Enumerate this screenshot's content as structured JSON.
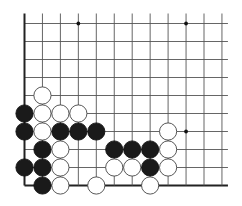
{
  "board": {
    "type": "go-diagram",
    "view": "lower-left corner fragment",
    "columns": 12,
    "rows": 10,
    "grid": {
      "x0": 24.5,
      "y0": 23.5,
      "dx": 17.95,
      "dy": 18,
      "line_color": "#555555",
      "edge_color": "#222222",
      "background": "#ffffff",
      "line_extend_top": 10,
      "line_extend_right": 6
    },
    "edges": {
      "left": true,
      "bottom": true,
      "top": false,
      "right": false
    },
    "star_points": [
      {
        "col": 3,
        "row": 0
      },
      {
        "col": 9,
        "row": 0
      },
      {
        "col": 9,
        "row": 6
      }
    ],
    "stones": [
      {
        "color": "white",
        "col": 1,
        "row": 4
      },
      {
        "color": "black",
        "col": 0,
        "row": 5
      },
      {
        "color": "white",
        "col": 1,
        "row": 5
      },
      {
        "color": "white",
        "col": 2,
        "row": 5
      },
      {
        "color": "white",
        "col": 3,
        "row": 5
      },
      {
        "color": "black",
        "col": 0,
        "row": 6
      },
      {
        "color": "white",
        "col": 1,
        "row": 6
      },
      {
        "color": "black",
        "col": 2,
        "row": 6
      },
      {
        "color": "black",
        "col": 3,
        "row": 6
      },
      {
        "color": "black",
        "col": 4,
        "row": 6
      },
      {
        "color": "white",
        "col": 8,
        "row": 6
      },
      {
        "color": "black",
        "col": 1,
        "row": 7
      },
      {
        "color": "white",
        "col": 2,
        "row": 7
      },
      {
        "color": "black",
        "col": 5,
        "row": 7
      },
      {
        "color": "black",
        "col": 6,
        "row": 7
      },
      {
        "color": "black",
        "col": 7,
        "row": 7
      },
      {
        "color": "white",
        "col": 8,
        "row": 7
      },
      {
        "color": "black",
        "col": 0,
        "row": 8
      },
      {
        "color": "black",
        "col": 1,
        "row": 8
      },
      {
        "color": "white",
        "col": 2,
        "row": 8
      },
      {
        "color": "white",
        "col": 5,
        "row": 8
      },
      {
        "color": "white",
        "col": 6,
        "row": 8
      },
      {
        "color": "black",
        "col": 7,
        "row": 8
      },
      {
        "color": "white",
        "col": 8,
        "row": 8
      },
      {
        "color": "black",
        "col": 1,
        "row": 9
      },
      {
        "color": "white",
        "col": 2,
        "row": 9
      },
      {
        "color": "white",
        "col": 4,
        "row": 9
      },
      {
        "color": "white",
        "col": 7,
        "row": 9
      }
    ],
    "stone_colors": {
      "black": {
        "fill": "#1a1a1a",
        "stroke": "#111111"
      },
      "white": {
        "fill": "#ffffff",
        "stroke": "#444444"
      }
    },
    "stone_radius": 8.6
  }
}
